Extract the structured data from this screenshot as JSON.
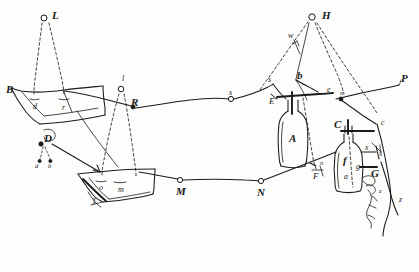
{
  "figure": {
    "kind": "hand-drawn-ink-sketch",
    "ink_color": "#1a1a1a",
    "paper_color": "#fdfdfb",
    "line_style": "freehand ink, dashed guide lines"
  },
  "labels": [
    {
      "id": "L",
      "text": "L",
      "x": 52,
      "y": 10,
      "size": "cap",
      "note": "elevated point upper left, small circle node"
    },
    {
      "id": "H",
      "text": "H",
      "x": 322,
      "y": 10,
      "size": "cap",
      "note": "elevated point upper right, small circle node"
    },
    {
      "id": "B",
      "text": "B",
      "x": 6,
      "y": 84,
      "size": "cap",
      "note": "left plate corner"
    },
    {
      "id": "d",
      "text": "d",
      "x": 33,
      "y": 103,
      "size": "sm",
      "note": "on left plate"
    },
    {
      "id": "r",
      "text": "r",
      "x": 62,
      "y": 104,
      "size": "sm",
      "note": "on left plate"
    },
    {
      "id": "l",
      "text": "l",
      "x": 122,
      "y": 75,
      "size": "sm",
      "note": "above node R"
    },
    {
      "id": "R",
      "text": "R",
      "x": 131,
      "y": 97,
      "size": "cap",
      "note": "node on upper wire"
    },
    {
      "id": "D",
      "text": "D",
      "x": 44,
      "y": 133,
      "size": "cap",
      "note": "node left of lower plate"
    },
    {
      "id": "d2",
      "text": "d",
      "x": 37,
      "y": 159,
      "size": "xs",
      "note": "small dashed drop"
    },
    {
      "id": "b2",
      "text": "b",
      "x": 48,
      "y": 159,
      "size": "xs",
      "note": "small dashed drop"
    },
    {
      "id": "o",
      "text": "o",
      "x": 99,
      "y": 184,
      "size": "sm",
      "note": "on lower plate"
    },
    {
      "id": "m",
      "text": "m",
      "x": 118,
      "y": 186,
      "size": "sm",
      "note": "on lower plate"
    },
    {
      "id": "T",
      "text": "T",
      "x": 92,
      "y": 198,
      "size": "sm",
      "note": "under lower plate"
    },
    {
      "id": "M",
      "text": "M",
      "x": 178,
      "y": 189,
      "size": "cap",
      "note": "node on lower wire"
    },
    {
      "id": "N",
      "text": "N",
      "x": 258,
      "y": 189,
      "size": "cap",
      "note": "node on lower wire"
    },
    {
      "id": "s1",
      "text": "s",
      "x": 229,
      "y": 89,
      "size": "sm",
      "note": "node on upper wire"
    },
    {
      "id": "s2",
      "text": "s",
      "x": 268,
      "y": 79,
      "size": "sm",
      "note": "bend in upper wire"
    },
    {
      "id": "E",
      "text": "E",
      "x": 270,
      "y": 98,
      "size": "md",
      "note": "terminal left of first jar"
    },
    {
      "id": "w",
      "text": "w",
      "x": 290,
      "y": 33,
      "size": "sm",
      "note": "on dashed line to H"
    },
    {
      "id": "b",
      "text": "b",
      "x": 298,
      "y": 74,
      "size": "cap",
      "note": "junction below H"
    },
    {
      "id": "e",
      "text": "e",
      "x": 327,
      "y": 89,
      "size": "sm",
      "note": "terminal right of first jar"
    },
    {
      "id": "n1",
      "text": "n",
      "x": 338,
      "y": 92,
      "size": "xs",
      "note": "on sloping wire"
    },
    {
      "id": "P",
      "text": "P",
      "x": 402,
      "y": 76,
      "size": "cap",
      "note": "right end of sloping wire"
    },
    {
      "id": "A",
      "text": "A",
      "x": 295,
      "y": 139,
      "size": "cap",
      "note": "inside first jar"
    },
    {
      "id": "n2",
      "text": "n",
      "x": 321,
      "y": 162,
      "size": "xs",
      "note": "below first jar"
    },
    {
      "id": "F",
      "text": "F",
      "x": 315,
      "y": 177,
      "size": "md",
      "note": "lower terminal of first jar"
    },
    {
      "id": "C",
      "text": "C",
      "x": 336,
      "y": 124,
      "size": "cap",
      "note": "top of second jar"
    },
    {
      "id": "c",
      "text": "c",
      "x": 381,
      "y": 122,
      "size": "sm",
      "note": "right of second jar top"
    },
    {
      "id": "f",
      "text": "f",
      "x": 345,
      "y": 160,
      "size": "cap",
      "note": "inside second jar"
    },
    {
      "id": "a",
      "text": "a",
      "x": 345,
      "y": 177,
      "size": "sm",
      "note": "inside second jar"
    },
    {
      "id": "g1",
      "text": "g",
      "x": 358,
      "y": 166,
      "size": "sm",
      "note": "inside second jar right"
    },
    {
      "id": "x",
      "text": "x",
      "x": 365,
      "y": 148,
      "size": "sm",
      "note": "right of second jar"
    },
    {
      "id": "s3",
      "text": "s",
      "x": 380,
      "y": 154,
      "size": "sm",
      "note": "right terminal"
    },
    {
      "id": "G",
      "text": "G",
      "x": 372,
      "y": 172,
      "size": "cap",
      "note": "right terminal, lower"
    },
    {
      "id": "z1",
      "text": "z",
      "x": 380,
      "y": 190,
      "size": "xs",
      "note": "on jagged edge"
    },
    {
      "id": "z2",
      "text": "z",
      "x": 400,
      "y": 199,
      "size": "sm",
      "note": "lower right terminus"
    }
  ],
  "nodes": [
    {
      "id": "node-L",
      "x": 44,
      "y": 18,
      "r": 3.0,
      "label": "L"
    },
    {
      "id": "node-H",
      "x": 312,
      "y": 17,
      "r": 3.2,
      "label": "H"
    },
    {
      "id": "node-l",
      "x": 121,
      "y": 89,
      "r": 2.8,
      "label": "l"
    },
    {
      "id": "node-R",
      "x": 133,
      "y": 107,
      "r": 2.0,
      "label": "R",
      "filled": true
    },
    {
      "id": "node-D",
      "x": 41,
      "y": 144,
      "r": 2.2,
      "label": "D",
      "filled": true
    },
    {
      "id": "node-s",
      "x": 231,
      "y": 99,
      "r": 2.6,
      "label": "s"
    },
    {
      "id": "node-M",
      "x": 180,
      "y": 180,
      "r": 2.6,
      "label": "M"
    },
    {
      "id": "node-N",
      "x": 261,
      "y": 181,
      "r": 2.6,
      "label": "N"
    },
    {
      "id": "node-n",
      "x": 341,
      "y": 99,
      "r": 2.0,
      "label": "n",
      "filled": true
    }
  ],
  "plates": [
    {
      "id": "plate-upper-left",
      "labels": [
        "B",
        "d",
        "r"
      ]
    },
    {
      "id": "plate-lower-left",
      "labels": [
        "o",
        "m",
        "T"
      ]
    }
  ],
  "jars": [
    {
      "id": "jar-A",
      "label": "A",
      "terminals": [
        "E",
        "e",
        "n",
        "F"
      ]
    },
    {
      "id": "jar-C",
      "label": "C",
      "contents": [
        "f",
        "a",
        "g"
      ],
      "terminals": [
        "c",
        "x",
        "s",
        "G"
      ]
    }
  ],
  "wires": [
    {
      "id": "wire-upper",
      "from": "B",
      "through": [
        "r",
        "R",
        "s",
        "s2",
        "E"
      ],
      "to": "jar-A"
    },
    {
      "id": "wire-lower",
      "from": "T",
      "through": [
        "m",
        "M",
        "N",
        "n"
      ],
      "to": "jar-C"
    },
    {
      "id": "wire-sloping-P",
      "from": "P",
      "through": [
        "n"
      ],
      "to": "jar-C-top"
    },
    {
      "id": "dashed-to-L",
      "from": "L",
      "to": [
        "d",
        "r"
      ],
      "style": "dashed"
    },
    {
      "id": "dashed-to-l",
      "from": "l",
      "to": [
        "o",
        "m"
      ],
      "style": "dashed"
    },
    {
      "id": "dashed-to-H",
      "from": "H",
      "to": [
        "b",
        "w",
        "c"
      ],
      "style": "dashed"
    }
  ]
}
